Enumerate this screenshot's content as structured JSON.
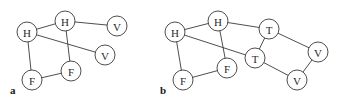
{
  "panels": [
    {
      "label": "a",
      "nodes": [
        {
          "id": "H1",
          "label": "H"
        },
        {
          "id": "H2",
          "label": "H"
        },
        {
          "id": "V1",
          "label": "V"
        },
        {
          "id": "V2",
          "label": "V"
        },
        {
          "id": "F1",
          "label": "F"
        },
        {
          "id": "F2",
          "label": "F"
        }
      ],
      "edges": [
        [
          "H1",
          "H2"
        ],
        [
          "H1",
          "F1"
        ],
        [
          "H1",
          "V2"
        ],
        [
          "H2",
          "V1"
        ],
        [
          "H2",
          "F2"
        ],
        [
          "F1",
          "F2"
        ]
      ]
    },
    {
      "label": "b",
      "nodes": [
        {
          "id": "H1",
          "label": "H"
        },
        {
          "id": "H2",
          "label": "H"
        },
        {
          "id": "T1",
          "label": "T"
        },
        {
          "id": "T2",
          "label": "T"
        },
        {
          "id": "V1",
          "label": "V"
        },
        {
          "id": "V2",
          "label": "V"
        },
        {
          "id": "F1",
          "label": "F"
        },
        {
          "id": "F2",
          "label": "F"
        }
      ],
      "edges": [
        [
          "H1",
          "H2"
        ],
        [
          "H1",
          "F1"
        ],
        [
          "H1",
          "T2"
        ],
        [
          "H2",
          "F2"
        ],
        [
          "H2",
          "T1"
        ],
        [
          "F1",
          "F2"
        ],
        [
          "T1",
          "T2"
        ],
        [
          "T1",
          "V1"
        ],
        [
          "T2",
          "V2"
        ],
        [
          "V1",
          "V2"
        ]
      ]
    }
  ]
}
